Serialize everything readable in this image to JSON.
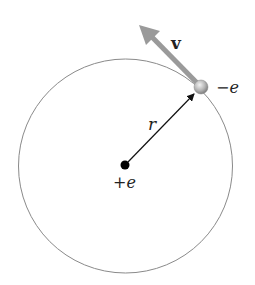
{
  "diagram": {
    "labels": {
      "velocity": "v",
      "electron_charge": "−e",
      "radius": "r",
      "nucleus_charge": "+e"
    },
    "colors": {
      "orbit": "#8a8a8a",
      "velocity_arrow": "#9a9a9a",
      "radius_arrow": "#111111",
      "nucleus": "#000000",
      "electron": "#b8b8b8"
    }
  }
}
